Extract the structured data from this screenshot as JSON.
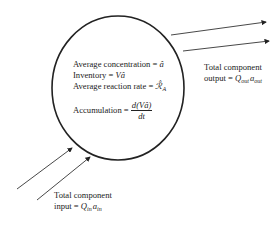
{
  "diagram": {
    "system": {
      "shape": "ellipse",
      "lines": {
        "avg_concentration_label": "Average concentration = ",
        "avg_concentration_symbol": "â",
        "inventory_label": "Inventory = ",
        "inventory_symbol": "Vâ",
        "avg_reaction_rate_label": "Average reaction rate = ",
        "avg_reaction_rate_symbol": "ℛ̂",
        "avg_reaction_rate_sub": "A",
        "accumulation_label": "Accumulation = ",
        "accumulation_num": "d(Vâ)",
        "accumulation_den": "dt"
      }
    },
    "output": {
      "line1": "Total component",
      "line2_prefix": "output = ",
      "q": "Q",
      "q_sub": "out",
      "a": "a",
      "a_sub": "out"
    },
    "input": {
      "line1": "Total component",
      "line2_prefix": "input = ",
      "q": "Q",
      "q_sub": "in",
      "a": "a",
      "a_sub": "in"
    },
    "colors": {
      "stroke": "#222222",
      "background": "#ffffff"
    }
  }
}
